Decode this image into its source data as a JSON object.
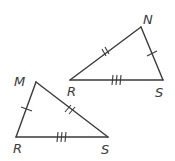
{
  "diagram": {
    "type": "congruent-triangles",
    "triangles": [
      {
        "id": "upper",
        "vertices": [
          {
            "name": "N",
            "label": "N",
            "x": 141,
            "y": 27
          },
          {
            "name": "R",
            "label": "R",
            "x": 70,
            "y": 80
          },
          {
            "name": "S",
            "label": "S",
            "x": 163,
            "y": 80
          }
        ],
        "sides": [
          {
            "from": "R",
            "to": "N",
            "tick_marks": 2
          },
          {
            "from": "N",
            "to": "S",
            "tick_marks": 1
          },
          {
            "from": "R",
            "to": "S",
            "tick_marks": 3
          }
        ]
      },
      {
        "id": "lower",
        "vertices": [
          {
            "name": "M",
            "label": "M",
            "x": 36,
            "y": 82
          },
          {
            "name": "R",
            "label": "R",
            "x": 16,
            "y": 137
          },
          {
            "name": "S",
            "label": "S",
            "x": 108,
            "y": 137
          }
        ],
        "sides": [
          {
            "from": "M",
            "to": "S",
            "tick_marks": 2
          },
          {
            "from": "M",
            "to": "R",
            "tick_marks": 1
          },
          {
            "from": "R",
            "to": "S",
            "tick_marks": 3
          }
        ]
      }
    ],
    "labels": {
      "upper_N": "N",
      "upper_R": "R",
      "upper_S": "S",
      "lower_M": "M",
      "lower_R": "R",
      "lower_S": "S"
    },
    "colors": {
      "stroke": "#3a3a3a",
      "background": "#ffffff"
    }
  }
}
